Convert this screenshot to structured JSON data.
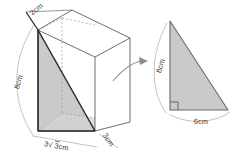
{
  "figure": {
    "colors": {
      "outline": "#5a5a5a",
      "hidden_edge": "#9a9a9a",
      "shaded_face": "#c9c9c9",
      "shaded_face_light": "#d6d6d6",
      "highlight_edge": "#2b2b2b",
      "arc": "#b0b0b0",
      "arrow": "#8a8a8a",
      "label_text": "#3a3a3a",
      "background": "#ffffff"
    },
    "prism": {
      "name": "triangular-prism",
      "labels": {
        "depth": "2cm",
        "height": "8cm",
        "base_front": "3√3cm",
        "base_side": "3cm"
      },
      "base_front_parts": {
        "coefficient": "3",
        "radical_symbol": "√",
        "radicand": "3",
        "unit": "cm"
      }
    },
    "arrow": {
      "name": "callout-arrow",
      "direction": "right"
    },
    "triangle": {
      "name": "enlarged-right-triangle",
      "labels": {
        "vertical_leg": "8cm",
        "horizontal_leg": "6cm"
      },
      "right_angle_marker": true,
      "right_angle_position": "bottom-left"
    }
  }
}
